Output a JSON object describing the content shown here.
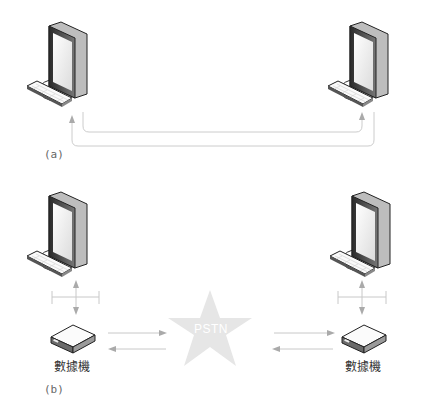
{
  "figure": {
    "panel_a": {
      "label": "(a)",
      "nodes": [
        "computer-left",
        "computer-right"
      ],
      "connection": "direct-link"
    },
    "panel_b": {
      "label": "(b)",
      "network_label": "PSTN",
      "modem_left_label": "數據機",
      "modem_right_label": "數據機"
    },
    "colors": {
      "line": "#c8c8c8",
      "arrow": "#a8a8a8",
      "star": "#e6e6e6",
      "monitor_frame": "#3a3a3a",
      "screen": "#f2f2f2"
    }
  }
}
